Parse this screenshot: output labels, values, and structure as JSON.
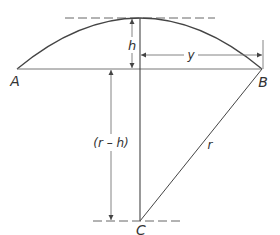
{
  "diagram": {
    "points": {
      "A": {
        "label": "A"
      },
      "B": {
        "label": "B"
      },
      "C": {
        "label": "C"
      }
    },
    "dimensions": {
      "h": {
        "label": "h"
      },
      "y": {
        "label": "y"
      },
      "r_minus_h": {
        "label": "(r – h)"
      },
      "r": {
        "label": "r"
      }
    },
    "colors": {
      "stroke": "#444444",
      "text": "#333333",
      "background": "#ffffff"
    }
  }
}
